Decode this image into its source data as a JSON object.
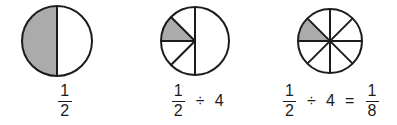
{
  "colors": {
    "background": "#ffffff",
    "stroke": "#1c1c1c",
    "shaded": "#ababab",
    "unshaded": "#ffffff",
    "text": "#1c1c1c"
  },
  "figures": [
    {
      "id": "figure-one-half",
      "diagram": {
        "shape": "circle",
        "total_sectors": 2,
        "shaded_sectors": 1,
        "shaded_indices": [
          0
        ],
        "division_lines": [
          "vertical-diameter"
        ],
        "radius": 35,
        "stroke_width": 2
      },
      "caption": {
        "numerator": "1",
        "denominator": "2"
      }
    },
    {
      "id": "figure-one-half-divided-by-four",
      "diagram": {
        "shape": "circle",
        "total_sectors": 5,
        "shaded_sectors": 1,
        "shaded_indices": [
          1
        ],
        "description": "left half split into four equal sectors, right half whole",
        "radius": 34,
        "stroke_width": 2
      },
      "caption": {
        "numerator": "1",
        "denominator": "2",
        "operator": "÷",
        "operand": "4"
      }
    },
    {
      "id": "figure-result-one-eighth",
      "diagram": {
        "shape": "circle",
        "total_sectors": 8,
        "shaded_sectors": 1,
        "shaded_indices": [
          3
        ],
        "description": "circle split into eight equal sectors, one shaded",
        "radius": 32,
        "stroke_width": 2
      },
      "caption": {
        "numerator": "1",
        "denominator": "2",
        "operator": "÷",
        "operand": "4",
        "equals": "=",
        "result_numerator": "1",
        "result_denominator": "8"
      }
    }
  ]
}
